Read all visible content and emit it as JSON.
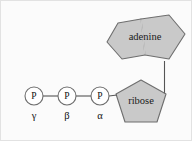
{
  "figure": {
    "background_color": "#fbfbfb",
    "frame_color": "#e2e2e2",
    "shape_fill": "#c9c9c9",
    "shape_stroke": "#6e6e6e",
    "bond_color": "#555555",
    "text_color": "#111111"
  },
  "base": {
    "label": "adenine",
    "shape": "purine-bicyclic"
  },
  "sugar": {
    "label": "ribose",
    "shape": "pentagon"
  },
  "phosphates": [
    {
      "symbol": "P",
      "greek": "γ",
      "name": "gamma-phosphate",
      "cx": 33,
      "cy": 95
    },
    {
      "symbol": "P",
      "greek": "β",
      "name": "beta-phosphate",
      "cx": 66,
      "cy": 95
    },
    {
      "symbol": "P",
      "greek": "α",
      "name": "alpha-phosphate",
      "cx": 99,
      "cy": 95
    }
  ],
  "bonds": [
    {
      "name": "gamma-beta-bond"
    },
    {
      "name": "beta-alpha-bond"
    },
    {
      "name": "alpha-ribose-bond"
    },
    {
      "name": "ribose-adenine-bond"
    }
  ]
}
